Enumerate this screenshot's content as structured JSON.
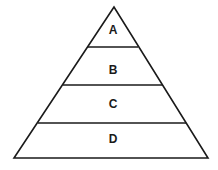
{
  "diagram": {
    "type": "pyramid",
    "levels": [
      {
        "label": "A"
      },
      {
        "label": "B"
      },
      {
        "label": "C"
      },
      {
        "label": "D"
      }
    ],
    "stroke_color": "#1a1a1a",
    "background": "#ffffff"
  }
}
